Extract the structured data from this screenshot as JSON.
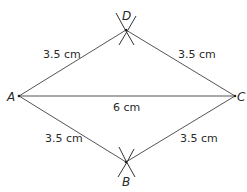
{
  "diagram": {
    "type": "geometric construction (rhombus / kite ABCD)",
    "points": {
      "A": {
        "label": "A",
        "x": 19,
        "y": 96
      },
      "B": {
        "label": "B",
        "x": 126,
        "y": 162
      },
      "C": {
        "label": "C",
        "x": 235,
        "y": 96
      },
      "D": {
        "label": "D",
        "x": 126,
        "y": 30
      }
    },
    "edges": [
      {
        "from": "A",
        "to": "D",
        "length": "3.5 cm"
      },
      {
        "from": "D",
        "to": "C",
        "length": "3.5 cm"
      },
      {
        "from": "A",
        "to": "B",
        "length": "3.5 cm"
      },
      {
        "from": "B",
        "to": "C",
        "length": "3.5 cm"
      },
      {
        "from": "A",
        "to": "C",
        "length": "6 cm"
      }
    ],
    "labels": {
      "ad": "3.5 cm",
      "dc": "3.5 cm",
      "ab": "3.5 cm",
      "bc": "3.5 cm",
      "ac": "6 cm"
    },
    "colors": {
      "line": "#555555",
      "text": "#2a2a2a",
      "background": "#ffffff"
    }
  }
}
